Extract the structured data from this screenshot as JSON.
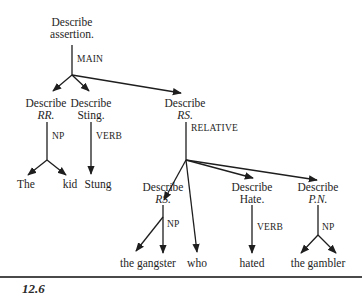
{
  "figure": {
    "caption_number": "12.6",
    "nodes": {
      "root": {
        "line1": "Describe",
        "line2": "assertion."
      },
      "rr": {
        "line1": "Describe",
        "line2": "RR."
      },
      "sting": {
        "line1": "Describe",
        "line2": "Sting."
      },
      "rs_top": {
        "line1": "Describe",
        "line2": "RS."
      },
      "rs_sub": {
        "line1": "Describe",
        "line2": "RS."
      },
      "hate": {
        "line1": "Describe",
        "line2": "Hate."
      },
      "pn": {
        "line1": "Describe",
        "line2": "P.N."
      }
    },
    "edge_labels": {
      "main": "MAIN",
      "np_rr": "NP",
      "verb_sting": "VERB",
      "relative": "RELATIVE",
      "np_rs": "NP",
      "verb_hate": "VERB",
      "np_pn": "NP"
    },
    "leaves": {
      "the": "The",
      "kid": "kid",
      "stung": "Stung",
      "the_gangster": "the gangster",
      "who": "who",
      "hated": "hated",
      "the_gambler": "the gambler"
    }
  }
}
